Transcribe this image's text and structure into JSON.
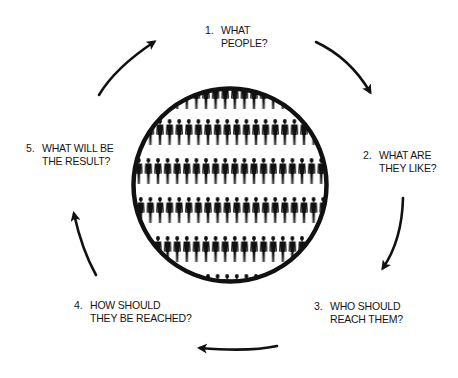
{
  "diagram": {
    "type": "cycle",
    "center_image": "crowd-of-people-silhouettes-in-circle",
    "steps": [
      {
        "number": "1.",
        "line1": "WHAT",
        "line2": "PEOPLE?"
      },
      {
        "number": "2.",
        "line1": "WHAT ARE",
        "line2": "THEY LIKE?"
      },
      {
        "number": "3.",
        "line1": "WHO SHOULD",
        "line2": "REACH  THEM?"
      },
      {
        "number": "4.",
        "line1": "HOW SHOULD",
        "line2": "THEY BE REACHED?"
      },
      {
        "number": "5.",
        "line1": "WHAT WILL BE",
        "line2": "THE RESULT?"
      }
    ],
    "arrow_direction": "clockwise",
    "colors": {
      "ink": "#111111",
      "background": "#ffffff"
    }
  }
}
